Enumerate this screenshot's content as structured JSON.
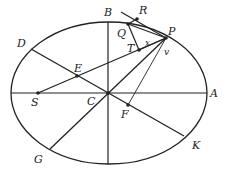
{
  "diagram": {
    "type": "ellipse-geometry",
    "labels": {
      "B": "B",
      "R": "R",
      "Q": "Q",
      "P": "P",
      "T": "T",
      "x": "x",
      "v": "v",
      "D": "D",
      "E": "E",
      "S": "S",
      "C": "C",
      "A": "A",
      "F": "F",
      "G": "G",
      "K": "K"
    },
    "colors": {
      "stroke": "#222222",
      "background": "#ffffff"
    }
  }
}
